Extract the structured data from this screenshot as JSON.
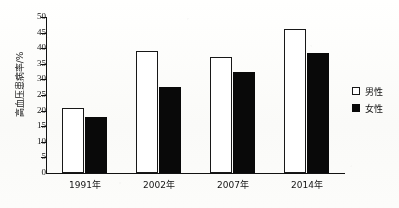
{
  "chart_data": {
    "type": "bar",
    "title": "",
    "xlabel": "",
    "ylabel": "高血压患病率/%",
    "ylim": [
      0,
      50
    ],
    "ytick_step": 5,
    "yticks": [
      "50",
      "45",
      "40",
      "35",
      "30",
      "25",
      "20",
      "15",
      "10",
      "5",
      "0"
    ],
    "categories": [
      "1991年",
      "2002年",
      "2007年",
      "2014年"
    ],
    "series": [
      {
        "name": "男性",
        "values": [
          20.8,
          39.2,
          37.2,
          46.0
        ],
        "color": "#ffffff",
        "edge": "#1a1a1a"
      },
      {
        "name": "女性",
        "values": [
          17.8,
          27.5,
          32.3,
          38.6
        ],
        "color": "#0b0b0b",
        "edge": "#0b0b0b"
      }
    ],
    "legend_position": "right",
    "grid": false
  },
  "legend": {
    "items": [
      {
        "label": "男性",
        "swatch": "hollow-square-icon"
      },
      {
        "label": "女性",
        "swatch": "filled-square-icon"
      }
    ]
  }
}
